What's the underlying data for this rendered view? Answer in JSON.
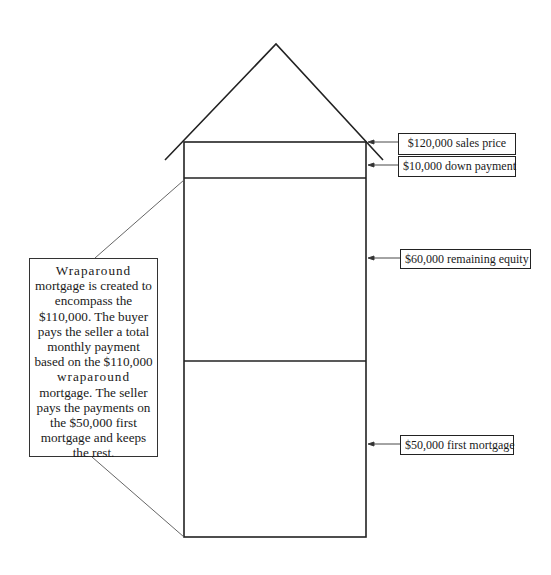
{
  "diagram": {
    "labels": [
      {
        "id": "sales-price",
        "text": "$120,000 sales price"
      },
      {
        "id": "down-payment",
        "text": "$10,000 down payment"
      },
      {
        "id": "remaining-equity",
        "text": "$60,000 remaining equity"
      },
      {
        "id": "first-mortgage",
        "text": "$50,000 first mortgage"
      }
    ],
    "callout": {
      "lines": [
        "Wraparound",
        "mortgage is created to",
        "encompass the",
        "$110,000.  The buyer",
        "pays the seller a total",
        "monthly payment",
        "based on the $110,000",
        "wraparound",
        "mortgage.  The seller",
        "pays the payments on",
        "the $50,000 first",
        "mortgage and keeps",
        "the rest."
      ]
    },
    "sections": [
      {
        "name": "down payment band"
      },
      {
        "name": "remaining equity"
      },
      {
        "name": "first mortgage"
      }
    ]
  }
}
